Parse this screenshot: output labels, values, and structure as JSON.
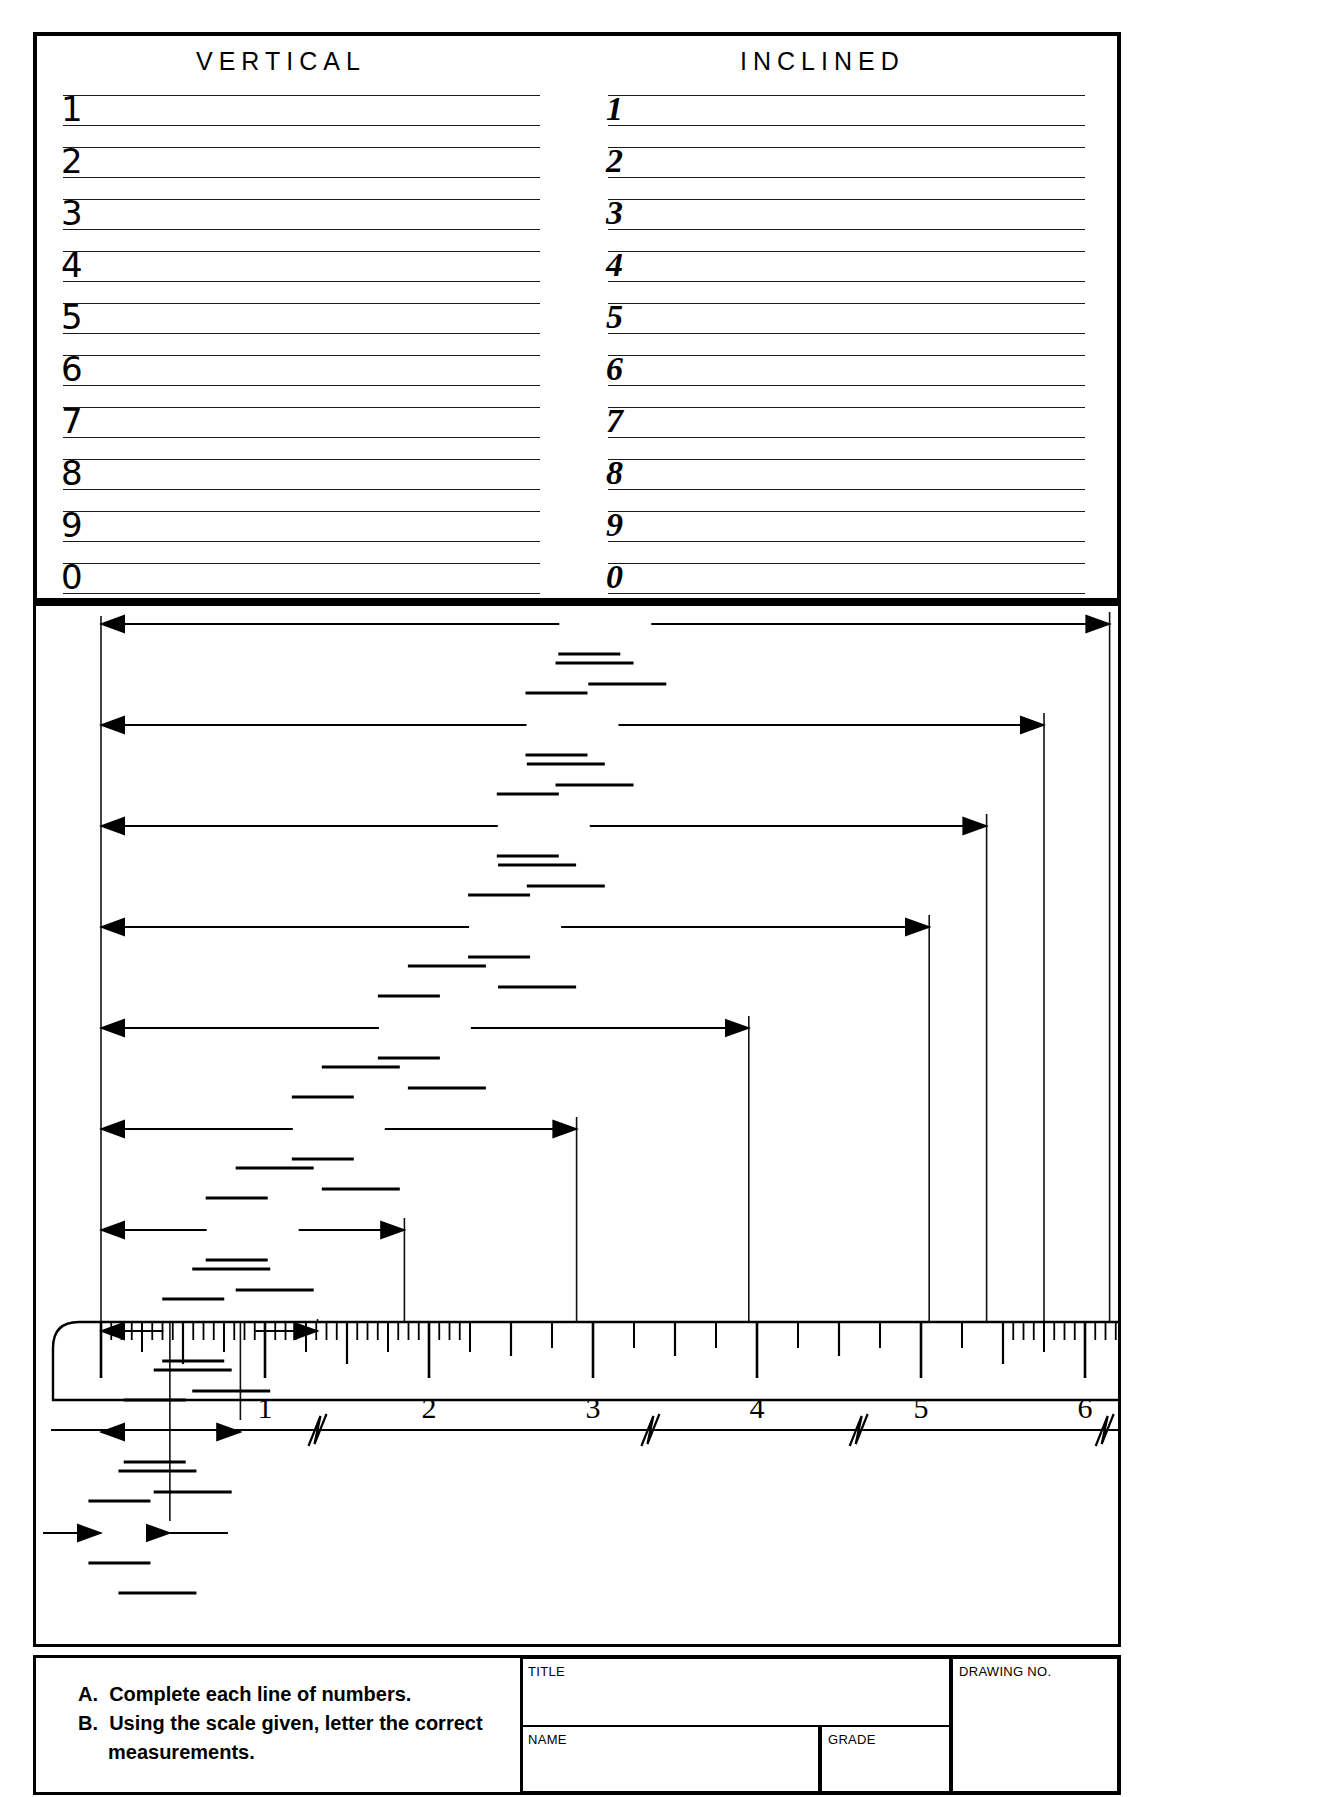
{
  "sheet": {
    "width": 1321,
    "height": 1797,
    "ink_color": "#000000",
    "paper_color": "#ffffff"
  },
  "practice_block": {
    "columns": [
      {
        "heading": "VERTICAL",
        "style": "upright"
      },
      {
        "heading": "INCLINED",
        "style": "slant"
      }
    ],
    "row_labels": [
      "1",
      "2",
      "3",
      "4",
      "5",
      "6",
      "7",
      "8",
      "9",
      "0"
    ]
  },
  "title_block": {
    "instructions": [
      {
        "key": "A.",
        "text": "Complete each line of numbers."
      },
      {
        "key": "B.",
        "text": "Using the scale given, letter the correct",
        "cont": "measurements."
      }
    ],
    "fields": [
      {
        "label": "TITLE",
        "value": ""
      },
      {
        "label": "NAME",
        "value": ""
      },
      {
        "label": "GRADE",
        "value": ""
      },
      {
        "label": "DRAWING NO.",
        "value": ""
      }
    ]
  },
  "chart_data": {
    "type": "bar",
    "title": "",
    "xlabel": "inches",
    "ylabel": "",
    "xlim": [
      0,
      6.2
    ],
    "grid": false,
    "legend": null,
    "categories": [
      "1",
      "2",
      "3",
      "4",
      "5",
      "6",
      "7",
      "8",
      "9",
      "10"
    ],
    "values": [
      6.15,
      5.75,
      5.4,
      5.05,
      3.95,
      2.9,
      1.85,
      1.32,
      0.85,
      0.42
    ],
    "scale": {
      "unit": "inch",
      "labeled_ticks": [
        "1",
        "2",
        "3",
        "4",
        "5",
        "6"
      ],
      "tick_values": [
        1,
        2,
        3,
        4,
        5,
        6
      ],
      "zero_position_px": 101,
      "pixels_per_inch": 164,
      "fine_divisions_left": 16,
      "fine_divisions_right": 16,
      "coarse_divisions_middle": 4,
      "break_symbols": 4
    }
  }
}
